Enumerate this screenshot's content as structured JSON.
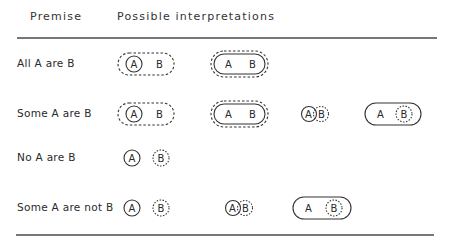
{
  "header": {
    "premise_label": "Premise",
    "interpretations_label": "Possible interpretations"
  },
  "rows": [
    {
      "premise": "All A are B",
      "interpretations": [
        {
          "type": "A-inside-B",
          "labels": [
            "A",
            "B"
          ]
        },
        {
          "type": "A-equals-B",
          "labels": [
            "A",
            "B"
          ]
        }
      ]
    },
    {
      "premise": "Some A are B",
      "interpretations": [
        {
          "type": "A-inside-B",
          "labels": [
            "A",
            "B"
          ]
        },
        {
          "type": "A-equals-B",
          "labels": [
            "A",
            "B"
          ]
        },
        {
          "type": "A-overlaps-B",
          "labels": [
            "A",
            "B"
          ]
        },
        {
          "type": "B-inside-A",
          "labels": [
            "A",
            "B"
          ]
        }
      ]
    },
    {
      "premise": "No A are B",
      "interpretations": [
        {
          "type": "A-disjoint-B",
          "labels": [
            "A",
            "B"
          ]
        }
      ]
    },
    {
      "premise": "Some A are not B",
      "interpretations": [
        {
          "type": "A-disjoint-B",
          "labels": [
            "A",
            "B"
          ]
        },
        {
          "type": "A-overlaps-B",
          "labels": [
            "A",
            "B"
          ]
        },
        {
          "type": "B-inside-A",
          "labels": [
            "A",
            "B"
          ]
        }
      ]
    }
  ],
  "legend": {
    "solid_outline": "A",
    "dashed_outline": "B"
  }
}
